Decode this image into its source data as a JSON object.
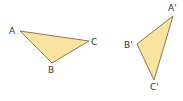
{
  "diagram": {
    "fill_color": "#f8e3a0",
    "stroke_color": "#8a7a55",
    "triangles": [
      {
        "name": "ABC",
        "vertices": {
          "A": {
            "label": "A",
            "x": 20,
            "y": 31
          },
          "B": {
            "label": "B",
            "x": 52,
            "y": 63
          },
          "C": {
            "label": "C",
            "x": 89,
            "y": 41
          }
        }
      },
      {
        "name": "A'B'C'",
        "vertices": {
          "A": {
            "label": "A'",
            "x": 173,
            "y": 16
          },
          "B": {
            "label": "B'",
            "x": 137,
            "y": 44
          },
          "C": {
            "label": "C'",
            "x": 154,
            "y": 80
          }
        }
      }
    ]
  }
}
